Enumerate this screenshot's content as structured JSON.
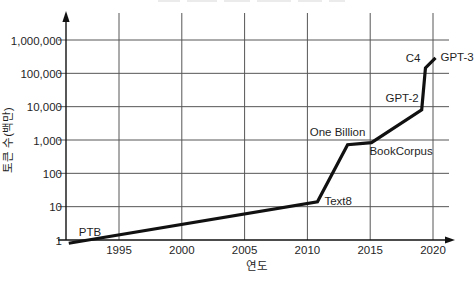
{
  "chart_data": {
    "type": "line",
    "title": "",
    "xlabel": "연도",
    "ylabel": "토큰 수(백만)",
    "x_scale": "linear",
    "y_scale": "log",
    "xlim": [
      1991,
      2021.5
    ],
    "ylim": [
      1,
      1000000
    ],
    "grid": "on",
    "legend": "none",
    "x_ticks": [
      "1995",
      "2000",
      "2005",
      "2010",
      "2015",
      "2020"
    ],
    "x_tick_values": [
      1995,
      2000,
      2005,
      2010,
      2015,
      2020
    ],
    "y_ticks": [
      "1,000,000",
      "100,000",
      "10,000",
      "1,000",
      "100",
      "10",
      "1"
    ],
    "y_tick_values": [
      1000000,
      100000,
      10000,
      1000,
      100,
      10,
      1
    ],
    "points": [
      {
        "label": "PTB",
        "year": 1991.0,
        "value": 0.8
      },
      {
        "label": "Text8",
        "year": 2010.8,
        "value": 14
      },
      {
        "label": "One Billion",
        "year": 2013.2,
        "value": 720
      },
      {
        "label": "BookCorpus",
        "year": 2015.1,
        "value": 830
      },
      {
        "label": "GPT-2",
        "year": 2019.1,
        "value": 8000
      },
      {
        "label": "C4",
        "year": 2019.4,
        "value": 145000
      },
      {
        "label": "GPT-3",
        "year": 2020.2,
        "value": 290000
      }
    ],
    "line_color": "#111111",
    "grid_color": "#565656",
    "axis_color": "#111111"
  }
}
